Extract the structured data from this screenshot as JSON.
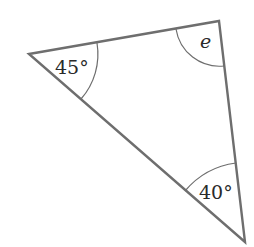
{
  "diagram": {
    "type": "triangle",
    "stroke_color": "#6e6e6e",
    "vertices": {
      "left": {
        "x": 29,
        "y": 54
      },
      "top_right": {
        "x": 219,
        "y": 21
      },
      "bottom_right": {
        "x": 245,
        "y": 242
      }
    },
    "angles": [
      {
        "vertex": "left",
        "label": "45°"
      },
      {
        "vertex": "top_right",
        "label": "e"
      },
      {
        "vertex": "bottom_right",
        "label": "40°"
      }
    ]
  }
}
